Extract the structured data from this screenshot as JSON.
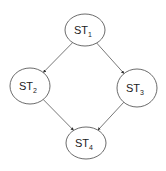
{
  "diagram": {
    "type": "directed-graph",
    "nodes": [
      {
        "id": "st1",
        "label": "ST",
        "subscript": "1",
        "cx": 85,
        "cy": 30,
        "rx": 20,
        "ry": 16
      },
      {
        "id": "st2",
        "label": "ST",
        "subscript": "2",
        "cx": 30,
        "cy": 86,
        "rx": 20,
        "ry": 18
      },
      {
        "id": "st3",
        "label": "ST",
        "subscript": "3",
        "cx": 137,
        "cy": 88,
        "rx": 20,
        "ry": 19
      },
      {
        "id": "st4",
        "label": "ST",
        "subscript": "4",
        "cx": 86,
        "cy": 143,
        "rx": 20,
        "ry": 16
      }
    ],
    "edges": [
      {
        "from": "st1",
        "to": "st2"
      },
      {
        "from": "st1",
        "to": "st3"
      },
      {
        "from": "st2",
        "to": "st4"
      },
      {
        "from": "st3",
        "to": "st4"
      }
    ],
    "colors": {
      "stroke": "#5a5a5a",
      "edge": "#555555",
      "text": "#222222",
      "background": "#ffffff"
    }
  }
}
